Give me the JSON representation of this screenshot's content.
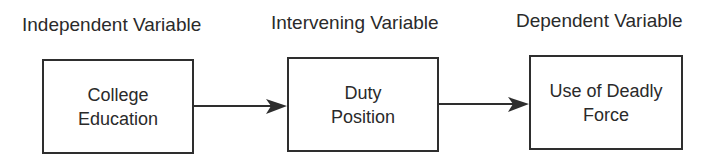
{
  "diagram": {
    "nodes": [
      {
        "id": "iv",
        "heading": "Independent Variable",
        "line1": "College",
        "line2": "Education"
      },
      {
        "id": "mv",
        "heading": "Intervening Variable",
        "line1": "Duty",
        "line2": "Position"
      },
      {
        "id": "dv",
        "heading": "Dependent Variable",
        "line1": "Use of Deadly",
        "line2": "Force"
      }
    ],
    "edges": [
      {
        "from": "iv",
        "to": "mv"
      },
      {
        "from": "mv",
        "to": "dv"
      }
    ],
    "colors": {
      "stroke": "#2e2e2e",
      "text": "#2a2a2a",
      "background": "#ffffff"
    }
  }
}
